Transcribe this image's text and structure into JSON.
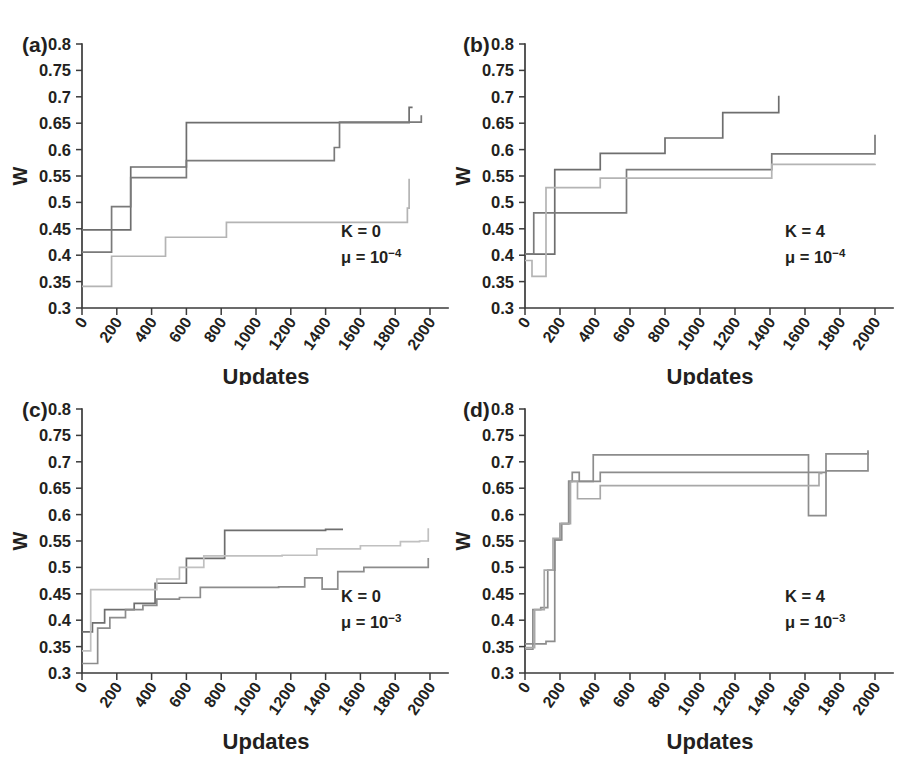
{
  "figure": {
    "background": "#ffffff",
    "axis_color": "#3b3b3b",
    "text_color": "#231f20"
  },
  "axes": {
    "xlabel": "Updates",
    "ylabel": "W",
    "xlim": [
      0,
      2000
    ],
    "ylim": [
      0.3,
      0.8
    ],
    "xticks": [
      "0",
      "200",
      "400",
      "600",
      "800",
      "1000",
      "1200",
      "1400",
      "1600",
      "1800",
      "2000"
    ],
    "yticks": [
      "0.8",
      "0.75",
      "0.7",
      "0.65",
      "0.6",
      "0.55",
      "0.5",
      "0.45",
      "0.4",
      "0.35",
      "0.3"
    ],
    "grid": false,
    "legend": "none",
    "spines": "left-and-bottom-only"
  },
  "panels": [
    {
      "label": "(a)",
      "annotation_k": "K = 0",
      "annotation_mu_base": "μ = 10",
      "annotation_mu_exp": "−4"
    },
    {
      "label": "(b)",
      "annotation_k": "K = 4",
      "annotation_mu_base": "μ = 10",
      "annotation_mu_exp": "−4"
    },
    {
      "label": "(c)",
      "annotation_k": "K = 0",
      "annotation_mu_base": "μ = 10",
      "annotation_mu_exp": "−3"
    },
    {
      "label": "(d)",
      "annotation_k": "K = 4",
      "annotation_mu_base": "μ = 10",
      "annotation_mu_exp": "−3"
    }
  ],
  "chart_data": [
    {
      "type": "line",
      "drawstyle": "steps-post",
      "panel": "(a)",
      "title": "",
      "xlabel": "Updates",
      "ylabel": "W",
      "xlim": [
        0,
        2000
      ],
      "ylim": [
        0.3,
        0.8
      ],
      "grid": false,
      "legend": "none",
      "annotations": [
        "K = 0",
        "μ = 10−4"
      ],
      "series": [
        {
          "name": "run-1",
          "color": "#6e6e6e",
          "x": [
            0,
            150,
            280,
            600,
            1390,
            1880,
            1900
          ],
          "y": [
            0.448,
            0.448,
            0.567,
            0.651,
            0.651,
            0.68,
            0.68
          ]
        },
        {
          "name": "run-2",
          "color": "#7a7a7a",
          "x": [
            0,
            60,
            170,
            280,
            600,
            1300,
            1450,
            1480,
            1950
          ],
          "y": [
            0.406,
            0.406,
            0.492,
            0.547,
            0.579,
            0.579,
            0.604,
            0.652,
            0.665
          ]
        },
        {
          "name": "run-3",
          "color": "#b4b4b4",
          "x": [
            0,
            45,
            170,
            480,
            830,
            1870,
            1880
          ],
          "y": [
            0.341,
            0.341,
            0.398,
            0.434,
            0.462,
            0.489,
            0.545
          ]
        }
      ]
    },
    {
      "type": "line",
      "drawstyle": "steps-post",
      "panel": "(b)",
      "title": "",
      "xlabel": "Updates",
      "ylabel": "W",
      "xlim": [
        0,
        2000
      ],
      "ylim": [
        0.3,
        0.8
      ],
      "grid": false,
      "legend": "none",
      "annotations": [
        "K = 4",
        "μ = 10−4"
      ],
      "series": [
        {
          "name": "run-1",
          "color": "#6e6e6e",
          "x": [
            0,
            60,
            170,
            430,
            800,
            1130,
            1440,
            1450
          ],
          "y": [
            0.402,
            0.402,
            0.562,
            0.593,
            0.622,
            0.67,
            0.67,
            0.702
          ]
        },
        {
          "name": "run-2",
          "color": "#7a7a7a",
          "x": [
            0,
            50,
            170,
            430,
            580,
            1410,
            1990,
            2000
          ],
          "y": [
            0.402,
            0.48,
            0.48,
            0.48,
            0.562,
            0.592,
            0.592,
            0.628
          ]
        },
        {
          "name": "run-3",
          "color": "#b4b4b4",
          "x": [
            0,
            40,
            120,
            430,
            1410,
            2000
          ],
          "y": [
            0.39,
            0.36,
            0.528,
            0.546,
            0.572,
            0.573
          ]
        }
      ]
    },
    {
      "type": "line",
      "drawstyle": "steps-post",
      "panel": "(c)",
      "title": "",
      "xlabel": "Updates",
      "ylabel": "W",
      "xlim": [
        0,
        2000
      ],
      "ylim": [
        0.3,
        0.8
      ],
      "grid": false,
      "legend": "none",
      "annotations": [
        "K = 0",
        "μ = 10−3"
      ],
      "series": [
        {
          "name": "run-1",
          "color": "#6e6e6e",
          "x": [
            0,
            60,
            130,
            300,
            420,
            600,
            820,
            1400,
            1500
          ],
          "y": [
            0.378,
            0.395,
            0.42,
            0.432,
            0.47,
            0.517,
            0.57,
            0.572,
            0.572
          ]
        },
        {
          "name": "run-2",
          "color": "#c0c0c0",
          "x": [
            0,
            50,
            120,
            300,
            430,
            560,
            700,
            1150,
            1350,
            1600,
            1830,
            1940,
            1990
          ],
          "y": [
            0.342,
            0.458,
            0.458,
            0.458,
            0.478,
            0.5,
            0.522,
            0.523,
            0.535,
            0.541,
            0.549,
            0.55,
            0.574
          ]
        },
        {
          "name": "run-3",
          "color": "#8c8c8c",
          "x": [
            0,
            90,
            160,
            250,
            350,
            430,
            560,
            680,
            1130,
            1280,
            1380,
            1470,
            1620,
            1990
          ],
          "y": [
            0.318,
            0.385,
            0.405,
            0.42,
            0.428,
            0.44,
            0.443,
            0.462,
            0.463,
            0.48,
            0.459,
            0.492,
            0.5,
            0.518
          ]
        }
      ]
    },
    {
      "type": "line",
      "drawstyle": "steps-post",
      "panel": "(d)",
      "title": "",
      "xlabel": "Updates",
      "ylabel": "W",
      "xlim": [
        0,
        2000
      ],
      "ylim": [
        0.3,
        0.8
      ],
      "grid": false,
      "legend": "none",
      "annotations": [
        "K = 4",
        "μ = 10−3"
      ],
      "series": [
        {
          "name": "run-1",
          "color": "#8c8c8c",
          "x": [
            0,
            45,
            90,
            130,
            170,
            200,
            250,
            290,
            390,
            1600,
            1620,
            1700,
            1720,
            1950,
            1960
          ],
          "y": [
            0.345,
            0.42,
            0.424,
            0.495,
            0.552,
            0.583,
            0.663,
            0.663,
            0.713,
            0.713,
            0.598,
            0.598,
            0.683,
            0.683,
            0.722
          ]
        },
        {
          "name": "run-2",
          "color": "#8c8c8c",
          "x": [
            0,
            60,
            120,
            170,
            210,
            250,
            270,
            310,
            430,
            1200,
            1700,
            1720,
            1960
          ],
          "y": [
            0.355,
            0.355,
            0.36,
            0.552,
            0.583,
            0.663,
            0.68,
            0.663,
            0.68,
            0.68,
            0.68,
            0.715,
            0.718
          ]
        },
        {
          "name": "run-3",
          "color": "#a8a8a8",
          "x": [
            0,
            55,
            110,
            160,
            200,
            260,
            300,
            430,
            1190,
            1680,
            1700
          ],
          "y": [
            0.348,
            0.42,
            0.495,
            0.555,
            0.583,
            0.663,
            0.63,
            0.655,
            0.655,
            0.678,
            0.678
          ]
        }
      ]
    }
  ]
}
